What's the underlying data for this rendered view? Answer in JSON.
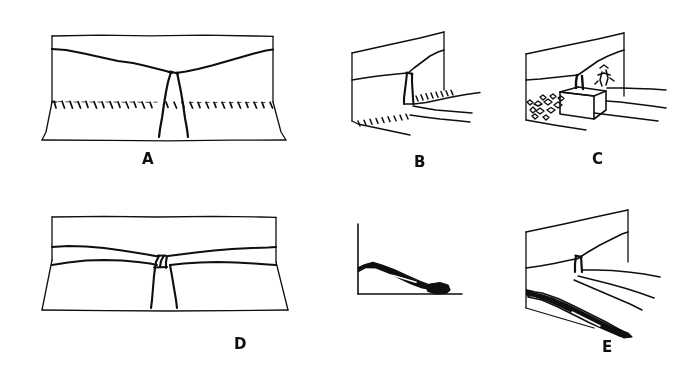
{
  "figure": {
    "background_color": "#fdfdfc",
    "ink_color": "#111111",
    "panel_count": 6,
    "labels": {
      "a": "A",
      "b": "B",
      "c": "C",
      "d": "D",
      "e": "E"
    },
    "panels": [
      {
        "id": "panel-a",
        "label": "A",
        "view": "front block diagram",
        "description": "Wide frontal block with arcuate head scarp meeting at central vertical fissure; hachured scarp line across lower slope",
        "features": [
          "block-outline",
          "upper-scarp-crack",
          "central-fissure",
          "hachured-scarp-line",
          "toe-line"
        ]
      },
      {
        "id": "panel-b",
        "label": "B",
        "view": "oblique block diagram",
        "description": "Oblique block showing scarp face with hachured crown crack and displaced tongue",
        "features": [
          "block-outline",
          "scarp-face",
          "hachure-row-upper",
          "hachure-row-lower",
          "fissure"
        ]
      },
      {
        "id": "panel-c",
        "label": "C",
        "view": "oblique block diagram with structures",
        "description": "Oblique block with a house astride the failure zone and rubble debris scattered on the left",
        "features": [
          "block-outline",
          "house",
          "debris-field",
          "scarp-crack",
          "tension-crack"
        ]
      },
      {
        "id": "panel-d",
        "label": "D",
        "view": "front block diagram",
        "description": "Wide frontal block with two parallel arcuate scarps and a central narrow graben/fissure",
        "features": [
          "block-outline",
          "upper-scarp",
          "lower-scarp",
          "central-graben",
          "toe-line"
        ]
      },
      {
        "id": "panel-profile",
        "label": "",
        "view": "cross-section profile",
        "description": "Right-angle axis frame enclosing a thick dark debris tongue running downslope to a bulbous toe deposit",
        "features": [
          "vertical-axis",
          "horizontal-axis",
          "debris-tongue",
          "toe-lobe"
        ]
      },
      {
        "id": "panel-e",
        "label": "E",
        "view": "oblique block diagram",
        "description": "Oblique block with narrow fissure at mid-slope and a dark elongate debris flow running to the lower right",
        "features": [
          "block-outline",
          "scarp-face",
          "fissure",
          "flow-lines",
          "dark-debris-tongue"
        ]
      }
    ]
  }
}
